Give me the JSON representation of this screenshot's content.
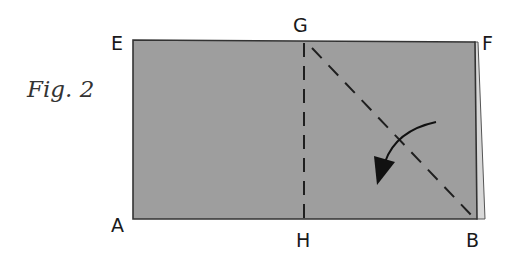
{
  "figure": {
    "caption": "Fig. 2",
    "points": {
      "E": "E",
      "F": "F",
      "G": "G",
      "H": "H",
      "A": "A",
      "B": "B"
    },
    "colors": {
      "paper": "#9d9d9d",
      "paper_edge": "#3a3a3a",
      "back_layer": "#d6d6d6",
      "fold_line": "#1f1f1f",
      "arrow": "#111111"
    },
    "folds": [
      {
        "name": "valley-fold-GH",
        "from": "G",
        "to": "H",
        "style": "dashed"
      },
      {
        "name": "valley-fold-GB",
        "from": "G",
        "to": "B",
        "style": "dashed"
      }
    ],
    "arrow": {
      "direction": "fold corner B/F toward lower-left",
      "head": "filled-triangle"
    }
  }
}
